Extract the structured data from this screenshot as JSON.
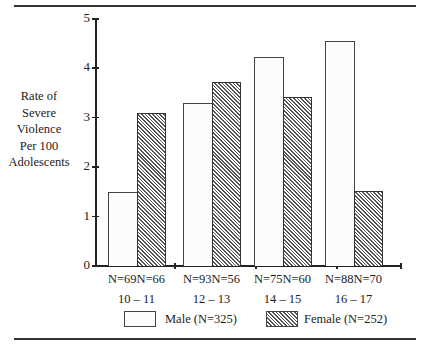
{
  "chart_data": {
    "type": "bar",
    "title": "",
    "xlabel": "Age group",
    "ylabel": "Rate of Severe Violence Per 100 Adolescents",
    "ylim": [
      0,
      5
    ],
    "yticks": [
      "0",
      "1",
      "2",
      "3",
      "4",
      "5"
    ],
    "categories": [
      "10 – 11",
      "12 – 13",
      "14 – 15",
      "16 – 17"
    ],
    "series": [
      {
        "name": "Male (N=325)",
        "values": [
          1.5,
          3.3,
          4.23,
          4.55
        ],
        "n_labels": [
          "N=69",
          "N=93",
          "N=75",
          "N=88"
        ],
        "style": "open"
      },
      {
        "name": "Female (N=252)",
        "values": [
          3.1,
          3.72,
          3.42,
          1.52
        ],
        "n_labels": [
          "N=66",
          "N=56",
          "N=60",
          "N=70"
        ],
        "style": "hatched"
      }
    ],
    "legend_position": "bottom",
    "grid": false
  },
  "ylabel_lines": [
    "Rate of",
    "Severe",
    "Violence",
    "Per 100",
    "Adolescents"
  ],
  "legend": {
    "male": "Male (N=325)",
    "female": "Female (N=252)"
  }
}
